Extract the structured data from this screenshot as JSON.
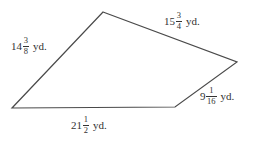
{
  "figure": {
    "name": "quadrilateral-with-side-lengths",
    "background_color": "#ffffff",
    "stroke_color": "#4a4a4a",
    "text_color": "#333333",
    "stroke_width": 1.2,
    "unit": "yd.",
    "vertices": {
      "apex": {
        "x": 103,
        "y": 12
      },
      "right": {
        "x": 237,
        "y": 62
      },
      "bottom_right": {
        "x": 175,
        "y": 107
      },
      "left": {
        "x": 12,
        "y": 108
      }
    },
    "polygon_points": "103,12 237,62 175,107 12,108"
  },
  "labels": {
    "left_side": {
      "whole": "14",
      "numerator": "3",
      "denominator": "8",
      "unit": "yd.",
      "full_text": "14 3/8 yd."
    },
    "top_side": {
      "whole": "15",
      "numerator": "3",
      "denominator": "4",
      "unit": "yd.",
      "full_text": "15 3/4 yd."
    },
    "right_side": {
      "whole": "9",
      "numerator": "1",
      "denominator": "16",
      "unit": "yd.",
      "full_text": "9 1/16 yd."
    },
    "bottom_side": {
      "whole": "21",
      "numerator": "1",
      "denominator": "2",
      "unit": "yd.",
      "full_text": "21 1/2 yd."
    }
  }
}
